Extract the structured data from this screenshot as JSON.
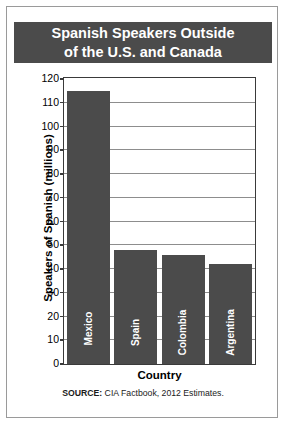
{
  "title": {
    "line1": "Spanish Speakers Outside",
    "line2": "of the U.S. and Canada"
  },
  "source": {
    "prefix": "SOURCE:",
    "text": " CIA Factbook, 2012 Estimates."
  },
  "colors": {
    "title_band": "#4b4b4b",
    "bar": "#4b4b4b",
    "bar_label": "#ffffff",
    "gridline": "#8d8d8d",
    "axis": "#3a3a3a",
    "frame": "#9a9a9a",
    "background": "#ffffff"
  },
  "chart_data": {
    "type": "bar",
    "title": "Spanish Speakers Outside of the U.S. and Canada",
    "xlabel": "Country",
    "ylabel": "Speakers of Spanish (millions)",
    "categories": [
      "Mexico",
      "Spain",
      "Colombia",
      "Argentina"
    ],
    "values": [
      115,
      48,
      46,
      42
    ],
    "ylim": [
      0,
      120
    ],
    "yticks": [
      0,
      10,
      20,
      30,
      40,
      50,
      60,
      70,
      80,
      90,
      100,
      110,
      120
    ],
    "ytick_labels": [
      "0",
      "10",
      "20",
      "30",
      "40",
      "50",
      "60",
      "70",
      "80",
      "90",
      "100",
      "110",
      "120"
    ],
    "grid": true,
    "legend": null,
    "annotation": "SOURCE: CIA Factbook, 2012 Estimates."
  }
}
